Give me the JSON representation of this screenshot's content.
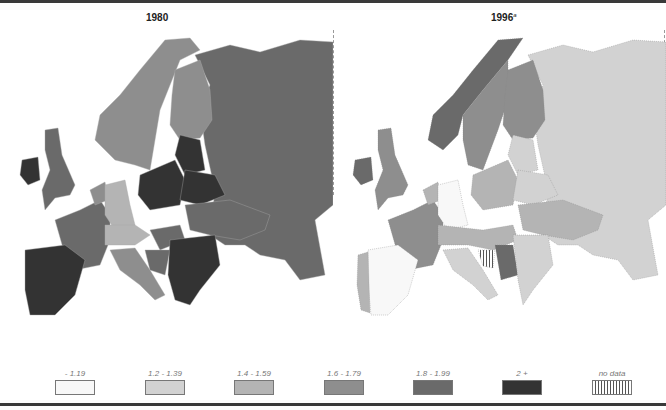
{
  "maps": [
    {
      "title": "1980",
      "footnote": "",
      "regions": {
        "russia": "1.8 - 1.99",
        "scandinavia": "1.6 - 1.79",
        "finland": "1.6 - 1.79",
        "uk": "1.8 - 1.99",
        "ireland": "2 +",
        "france": "1.8 - 1.99",
        "iberia": "2 +",
        "germany": "1.4 - 1.59",
        "benelux": "1.6 - 1.79",
        "poland": "2 +",
        "baltics": "2 +",
        "belarus": "2 +",
        "ukraine": "1.8 - 1.99",
        "austria_swiss": "1.4 - 1.59",
        "italy": "1.6 - 1.79",
        "balkans_east": "2 +",
        "yugoslavia": "1.8 - 1.99",
        "hungary": "1.8 - 1.99"
      }
    },
    {
      "title": "1996",
      "footnote": "a",
      "regions": {
        "russia": "1.2 - 1.39",
        "norway": "1.8 - 1.99",
        "sweden_finland": "1.6 - 1.79",
        "uk": "1.6 - 1.79",
        "ireland": "1.8 - 1.99",
        "france": "1.6 - 1.79",
        "spain": "- 1.19",
        "portugal": "1.4 - 1.59",
        "germany": "- 1.19",
        "poland": "1.4 - 1.59",
        "central": "1.2 - 1.39",
        "italy": "1.2 - 1.39",
        "yugoslavia": "1.8 - 1.99",
        "bosnia": "no data",
        "balkans": "1.2 - 1.39"
      }
    }
  ],
  "legend": {
    "items": [
      {
        "label": "- 1.19",
        "color": "#f8f8f8",
        "pattern": "solid"
      },
      {
        "label": "1.2 - 1.39",
        "color": "#d2d2d2",
        "pattern": "solid"
      },
      {
        "label": "1.4 - 1.59",
        "color": "#b4b4b4",
        "pattern": "solid"
      },
      {
        "label": "1.6 - 1.79",
        "color": "#8e8e8e",
        "pattern": "solid"
      },
      {
        "label": "1.8 - 1.99",
        "color": "#6a6a6a",
        "pattern": "solid"
      },
      {
        "label": "2 +",
        "color": "#333333",
        "pattern": "solid"
      },
      {
        "label": "no data",
        "color": "#ffffff",
        "pattern": "vertical-hatch"
      }
    ]
  }
}
